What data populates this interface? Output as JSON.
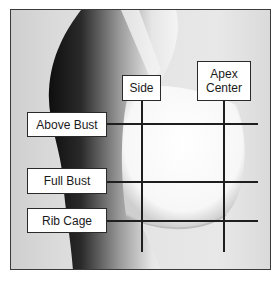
{
  "diagram": {
    "colors": {
      "line": "#1e1e1e",
      "frame": "#3a3a3a",
      "label_bg": "#ffffff"
    },
    "vertical_labels": [
      {
        "id": "side",
        "lines": [
          "Side"
        ]
      },
      {
        "id": "apex_center",
        "lines": [
          "Apex",
          "Center"
        ]
      }
    ],
    "horizontal_labels": [
      {
        "id": "above_bust",
        "label": "Above Bust"
      },
      {
        "id": "full_bust",
        "label": "Full Bust"
      },
      {
        "id": "rib_cage",
        "label": "Rib Cage"
      }
    ]
  }
}
